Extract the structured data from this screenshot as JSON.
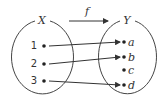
{
  "diagram": {
    "type": "function-mapping",
    "function_label": "f",
    "domain": {
      "label": "X",
      "elements": [
        "1",
        "2",
        "3"
      ]
    },
    "codomain": {
      "label": "Y",
      "elements": [
        "a",
        "b",
        "c",
        "d"
      ]
    },
    "mappings": [
      {
        "from": "1",
        "to": "a"
      },
      {
        "from": "2",
        "to": "b"
      },
      {
        "from": "3",
        "to": "d"
      }
    ],
    "colors": {
      "stroke": "#333333",
      "background": "#ffffff"
    }
  }
}
